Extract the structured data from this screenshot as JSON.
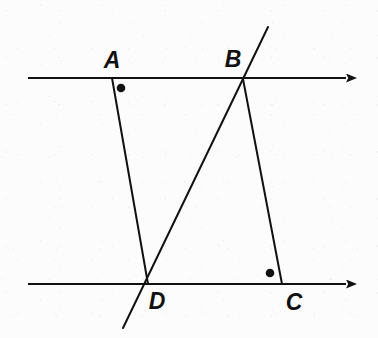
{
  "figure": {
    "canvas": {
      "width": 378,
      "height": 338
    },
    "background_color": "#fcfcfc",
    "stroke_color": "#111111",
    "labels": [
      {
        "id": "A",
        "text": "A",
        "x": 112,
        "y": 60
      },
      {
        "id": "B",
        "text": "B",
        "x": 233,
        "y": 59
      },
      {
        "id": "C",
        "text": "C",
        "x": 294,
        "y": 302
      },
      {
        "id": "D",
        "text": "D",
        "x": 157,
        "y": 301
      }
    ],
    "points": [
      {
        "id": "A",
        "x": 112,
        "y": 78
      },
      {
        "id": "B",
        "x": 243,
        "y": 79
      },
      {
        "id": "C",
        "x": 282,
        "y": 284
      },
      {
        "id": "D",
        "x": 148,
        "y": 284
      }
    ],
    "parallel_lines": [
      {
        "id": "top-parallel-line",
        "x1": 28,
        "y1": 78,
        "x2": 348,
        "y2": 78,
        "arrow_end": "right",
        "arrow_tip_x": 357
      },
      {
        "id": "bottom-parallel-line",
        "x1": 28,
        "y1": 284,
        "x2": 348,
        "y2": 284,
        "arrow_end": "right",
        "arrow_tip_x": 357
      }
    ],
    "segments": [
      {
        "id": "segment-AD",
        "from": "A",
        "to": "D",
        "x1": 112,
        "y1": 78,
        "x2": 148,
        "y2": 284
      },
      {
        "id": "segment-BC",
        "from": "B",
        "to": "C",
        "x1": 243,
        "y1": 79,
        "x2": 282,
        "y2": 284
      }
    ],
    "transversal": {
      "id": "transversal-DB",
      "through": [
        "D",
        "B"
      ],
      "x1": 123,
      "y1": 328,
      "x2": 268,
      "y2": 27
    },
    "angle_dots": [
      {
        "id": "angle-dot-at-A",
        "x": 121,
        "y": 88,
        "r": 4.3
      },
      {
        "id": "angle-dot-at-C",
        "x": 270,
        "y": 273,
        "r": 4.3
      }
    ],
    "stroke_widths": {
      "line": 2.0,
      "segment": 2.0,
      "transversal": 2.0
    }
  }
}
